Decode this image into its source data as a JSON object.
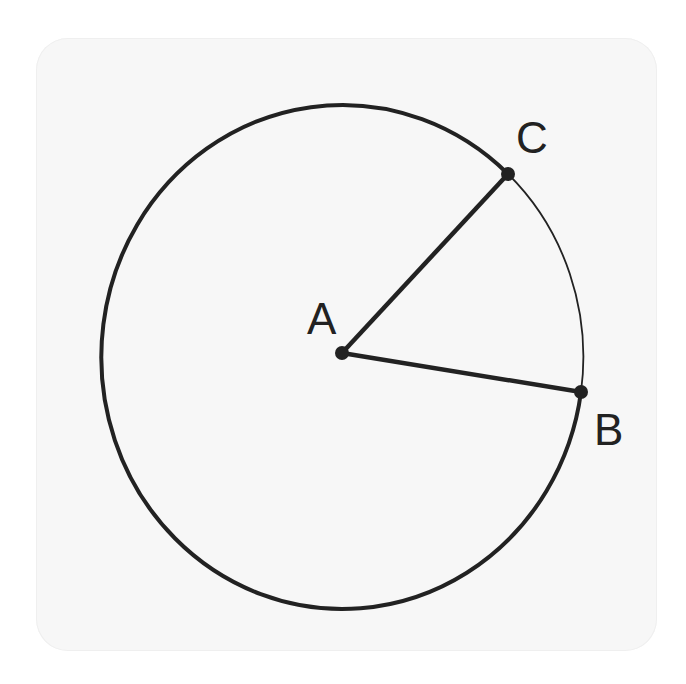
{
  "figure": {
    "colors": {
      "stroke": "#222222",
      "card": "#f7f7f7",
      "background": "#ffffff"
    },
    "circle": {
      "cx": 343,
      "cy": 353,
      "rx": 241,
      "ry": 252
    },
    "points": {
      "A": {
        "label": "A",
        "x": 342,
        "y": 353,
        "label_x": 307,
        "label_y": 334
      },
      "B": {
        "label": "B",
        "x": 581,
        "y": 392,
        "label_x": 594,
        "label_y": 445
      },
      "C": {
        "label": "C",
        "x": 508,
        "y": 174,
        "label_x": 516,
        "label_y": 153
      }
    },
    "segments": [
      {
        "name": "AB",
        "from": "A",
        "to": "B"
      },
      {
        "name": "AC",
        "from": "A",
        "to": "C"
      }
    ],
    "arcs": [
      {
        "name": "major-arc-BC",
        "weight": "thick"
      },
      {
        "name": "minor-arc-CB",
        "weight": "thin"
      }
    ]
  }
}
